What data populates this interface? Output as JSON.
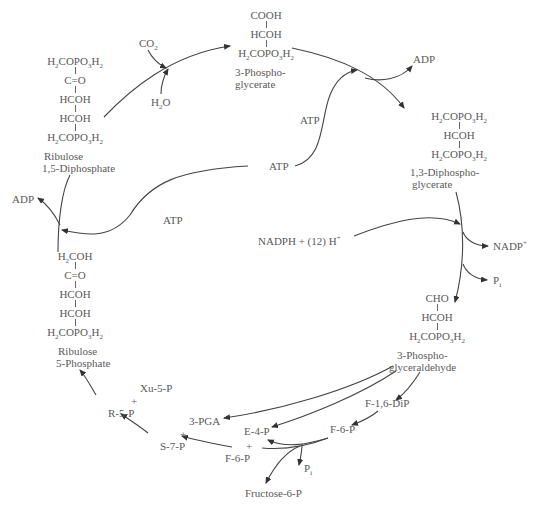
{
  "molecules": {
    "rubp": {
      "rows": [
        "H2COPO3H2",
        "C=O",
        "HCOH",
        "HCOH",
        "H2COPO3H2"
      ],
      "name_line1": "Ribulose",
      "name_line2": "1,5-Diphosphate"
    },
    "pga": {
      "rows": [
        "COOH",
        "HCOH",
        "H2COPO3H2"
      ],
      "name_line1": "3-Phospho-",
      "name_line2": "glycerate"
    },
    "dpg": {
      "rows": [
        "H2COPO3H2",
        "HCOH",
        "H2COPO3H2"
      ],
      "name_line1": "1,3-Diphospho-",
      "name_line2": "glycerate"
    },
    "gap": {
      "rows": [
        "CHO",
        "HCOH",
        "H2COPO3H2"
      ],
      "name_line1": "3-Phospho-",
      "name_line2": "glyceraldehyde"
    },
    "ru5p": {
      "rows": [
        "H2COH",
        "C=O",
        "HCOH",
        "HCOH",
        "H2COPO3H2"
      ],
      "name_line1": "Ribulose",
      "name_line2": "5-Phosphate"
    }
  },
  "labels": {
    "co2": "CO2",
    "h2o": "H2O",
    "adp_top": "ADP",
    "atp_upper": "ATP",
    "atp_middle": "ATP",
    "atp_left": "ATP",
    "adp_left": "ADP",
    "nadph": "NADPH + (12) H+",
    "nadp": "NADP+",
    "pi_right": "Pi",
    "xu5p": "Xu-5-P",
    "plus1": "+",
    "r5p": "R-5-P",
    "pga3": "3-PGA",
    "plus2": "+",
    "s7p": "S-7-P",
    "e4p": "E-4-P",
    "plus3": "+",
    "f6p_left": "F-6-P",
    "f16dip": "F-1,6-DiP",
    "f6p_right": "F-6-P",
    "pi_bottom": "Pi",
    "fructose6p": "Fructose-6-P"
  }
}
